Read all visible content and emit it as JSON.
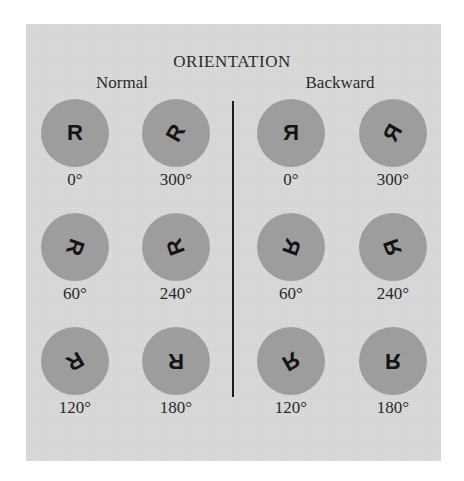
{
  "title": "ORIENTATION",
  "groups": [
    {
      "heading": "Normal",
      "items": [
        {
          "glyph": "R",
          "angle_label": "0°",
          "rotate": 0,
          "mirror": false
        },
        {
          "glyph": "R",
          "angle_label": "300°",
          "rotate": -60,
          "mirror": false
        },
        {
          "glyph": "R",
          "angle_label": "60°",
          "rotate": 110,
          "mirror": false
        },
        {
          "glyph": "R",
          "angle_label": "240°",
          "rotate": -110,
          "mirror": false
        },
        {
          "glyph": "R",
          "angle_label": "120°",
          "rotate": 150,
          "mirror": false
        },
        {
          "glyph": "R",
          "angle_label": "180°",
          "rotate": 180,
          "mirror": false
        }
      ]
    },
    {
      "heading": "Backward",
      "items": [
        {
          "glyph": "R",
          "angle_label": "0°",
          "rotate": 0,
          "mirror": true
        },
        {
          "glyph": "R",
          "angle_label": "300°",
          "rotate": -60,
          "mirror": true
        },
        {
          "glyph": "R",
          "angle_label": "60°",
          "rotate": 110,
          "mirror": true
        },
        {
          "glyph": "R",
          "angle_label": "240°",
          "rotate": -110,
          "mirror": true
        },
        {
          "glyph": "R",
          "angle_label": "120°",
          "rotate": 150,
          "mirror": true
        },
        {
          "glyph": "R",
          "angle_label": "180°",
          "rotate": 180,
          "mirror": true
        }
      ]
    }
  ],
  "colors": {
    "background": "#d6d6d6",
    "disc": "#9d9d9d",
    "ink": "#141414"
  }
}
